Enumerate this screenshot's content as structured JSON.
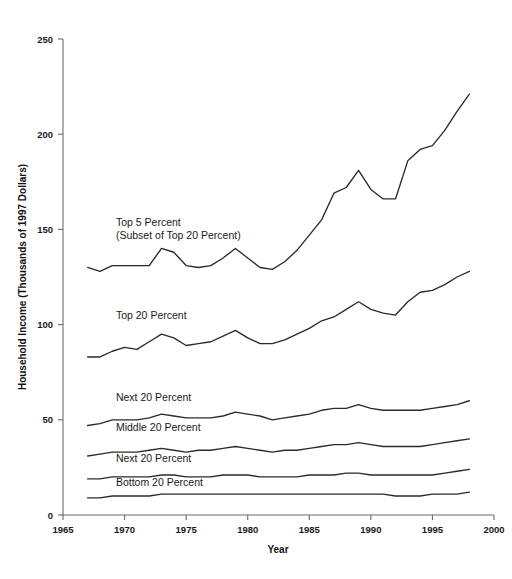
{
  "chart_data": {
    "type": "line",
    "title": "",
    "xlabel": "Year",
    "ylabel": "Household Income (Thousands of 1997 Dollars)",
    "xlim": [
      1965,
      2000
    ],
    "ylim": [
      0,
      250
    ],
    "xticks": [
      1965,
      1970,
      1975,
      1980,
      1985,
      1990,
      1995,
      2000
    ],
    "xtick_labels": [
      "1965",
      "1970",
      "1975",
      "1980",
      "1985",
      "1990",
      "1995",
      "2000"
    ],
    "yticks": [
      0,
      50,
      100,
      150,
      200,
      250
    ],
    "ytick_labels": [
      "0",
      "50",
      "100",
      "150",
      "200",
      "250"
    ],
    "grid": false,
    "legend_position": "inline-annotations",
    "x": [
      1967,
      1968,
      1969,
      1970,
      1971,
      1972,
      1973,
      1974,
      1975,
      1976,
      1977,
      1978,
      1979,
      1980,
      1981,
      1982,
      1983,
      1984,
      1985,
      1986,
      1987,
      1988,
      1989,
      1990,
      1991,
      1992,
      1993,
      1994,
      1995,
      1996,
      1997,
      1998
    ],
    "series": [
      {
        "name": "Top 5 Percent",
        "label": "Top 5 Percent",
        "sublabel": "(Subset of Top 20 Percent)",
        "values": [
          130,
          128,
          131,
          131,
          131,
          131,
          140,
          138,
          131,
          130,
          131,
          135,
          140,
          135,
          130,
          129,
          133,
          139,
          147,
          155,
          169,
          172,
          181,
          171,
          166,
          166,
          186,
          192,
          194,
          202,
          212,
          221
        ]
      },
      {
        "name": "Top 20 Percent",
        "label": "Top 20 Percent",
        "values": [
          83,
          83,
          86,
          88,
          87,
          91,
          95,
          93,
          89,
          90,
          91,
          94,
          97,
          93,
          90,
          90,
          92,
          95,
          98,
          102,
          104,
          108,
          112,
          108,
          106,
          105,
          112,
          117,
          118,
          121,
          125,
          128
        ]
      },
      {
        "name": "Next 20 Percent",
        "label": "Next 20 Percent",
        "values": [
          47,
          48,
          50,
          50,
          50,
          51,
          53,
          52,
          51,
          51,
          51,
          52,
          54,
          53,
          52,
          50,
          51,
          52,
          53,
          55,
          56,
          56,
          58,
          56,
          55,
          55,
          55,
          55,
          56,
          57,
          58,
          60
        ]
      },
      {
        "name": "Middle 20 Percent",
        "label": "Middle 20 Percent",
        "values": [
          31,
          32,
          33,
          33,
          33,
          34,
          35,
          34,
          33,
          34,
          34,
          35,
          36,
          35,
          34,
          33,
          34,
          34,
          35,
          36,
          37,
          37,
          38,
          37,
          36,
          36,
          36,
          36,
          37,
          38,
          39,
          40
        ]
      },
      {
        "name": "Next 20 Percent (second quintile)",
        "label": "Next 20 Percent",
        "values": [
          19,
          19,
          20,
          20,
          20,
          20,
          21,
          21,
          20,
          20,
          20,
          21,
          21,
          21,
          20,
          20,
          20,
          20,
          21,
          21,
          21,
          22,
          22,
          21,
          21,
          21,
          21,
          21,
          21,
          22,
          23,
          24
        ]
      },
      {
        "name": "Bottom 20 Percent",
        "label": "Bottom 20 Percent",
        "values": [
          9,
          9,
          10,
          10,
          10,
          10,
          11,
          11,
          11,
          11,
          11,
          11,
          11,
          11,
          11,
          11,
          11,
          11,
          11,
          11,
          11,
          11,
          11,
          11,
          11,
          10,
          10,
          10,
          11,
          11,
          11,
          12
        ]
      }
    ],
    "annotations": [
      {
        "text": "Top 5 Percent",
        "x": 1969.3,
        "y": 152
      },
      {
        "text": "(Subset of Top 20 Percent)",
        "x": 1969.3,
        "y": 145
      },
      {
        "text": "Top 20 Percent",
        "x": 1969.3,
        "y": 103
      },
      {
        "text": "Next 20 Percent",
        "x": 1969.3,
        "y": 60
      },
      {
        "text": "Middle 20 Percent",
        "x": 1969.3,
        "y": 44
      },
      {
        "text": "Next 20 Percent",
        "x": 1969.3,
        "y": 28
      },
      {
        "text": "Bottom 20 Percent",
        "x": 1969.3,
        "y": 15
      }
    ],
    "colors": {
      "line": "#2b2b2b",
      "axis": "#6b6b6b",
      "text": "#1a1a1a",
      "background": "#ffffff"
    }
  }
}
